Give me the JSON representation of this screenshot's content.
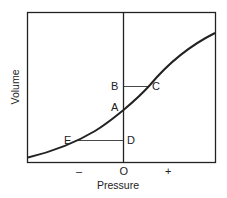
{
  "diagram": {
    "type": "pressure-volume curve",
    "x_axis": {
      "title": "Pressure",
      "ticks": [
        "–",
        "O",
        "+"
      ]
    },
    "y_axis": {
      "title": "Volume"
    },
    "points": {
      "A": "A",
      "B": "B",
      "C": "C",
      "D": "D",
      "E": "E"
    },
    "colors": {
      "line": "#222222",
      "background": "#ffffff"
    }
  }
}
